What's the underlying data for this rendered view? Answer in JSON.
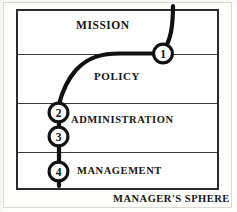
{
  "figure": {
    "caption": "MANAGER'S SPHERE",
    "bands": [
      {
        "id": "mission",
        "label": "MISSION"
      },
      {
        "id": "policy",
        "label": "POLICY"
      },
      {
        "id": "admin",
        "label": "ADMINISTRATION"
      },
      {
        "id": "management",
        "label": "MANAGEMENT"
      }
    ],
    "nodes": [
      {
        "number": "1"
      },
      {
        "number": "2"
      },
      {
        "number": "3"
      },
      {
        "number": "4"
      }
    ],
    "colors": {
      "ink": "#111111",
      "rule": "#3a3a3a",
      "frame": "#2b2b2b",
      "paper": "#ffffff"
    }
  }
}
